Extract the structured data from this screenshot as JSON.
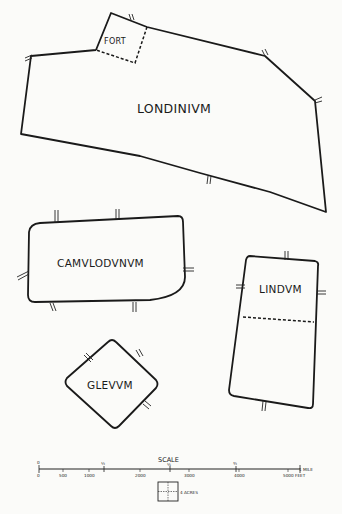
{
  "towns": [
    {
      "name": "LONDINIVM",
      "sub": {
        "name": "FORT"
      }
    },
    {
      "name": "CAMVLODVNVM"
    },
    {
      "name": "LINDVM"
    },
    {
      "name": "GLEVVM"
    }
  ],
  "scale": {
    "title": "SCALE",
    "mile_labels": [
      "0",
      "¼",
      "½",
      "¾",
      "1 MILE"
    ],
    "feet_labels": [
      "0",
      "500",
      "1000",
      "2000",
      "3000",
      "4000",
      "5000 FEET"
    ],
    "area_label": "4 ACRES"
  }
}
